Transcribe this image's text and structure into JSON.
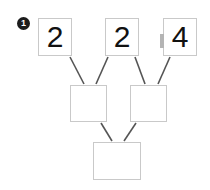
{
  "diagram": {
    "title": "",
    "step_badge": {
      "label": "1",
      "color": "#1c1c1c",
      "text_color": "#ffffff"
    },
    "style": {
      "box_border_color": "#c9c9c9",
      "box_fill_color": "#ffffff",
      "edge_color": "#555555",
      "digit_color": "#111111",
      "background": "#ffffff"
    },
    "nodes": [
      {
        "id": "a",
        "row": "top",
        "label": "2",
        "empty": false
      },
      {
        "id": "b",
        "row": "top",
        "label": "2",
        "empty": false
      },
      {
        "id": "c",
        "row": "top",
        "label": "4",
        "empty": false
      },
      {
        "id": "d",
        "row": "middle",
        "label": "",
        "empty": true
      },
      {
        "id": "e",
        "row": "middle",
        "label": "",
        "empty": true
      },
      {
        "id": "f",
        "row": "bottom",
        "label": "",
        "empty": true
      }
    ],
    "edges": [
      {
        "from": "a",
        "to": "d"
      },
      {
        "from": "b",
        "to": "d"
      },
      {
        "from": "b",
        "to": "e"
      },
      {
        "from": "c",
        "to": "e"
      },
      {
        "from": "d",
        "to": "f"
      },
      {
        "from": "e",
        "to": "f"
      }
    ],
    "marker": {
      "name": "left-edge-marker",
      "color": "#b4b4b4"
    }
  }
}
